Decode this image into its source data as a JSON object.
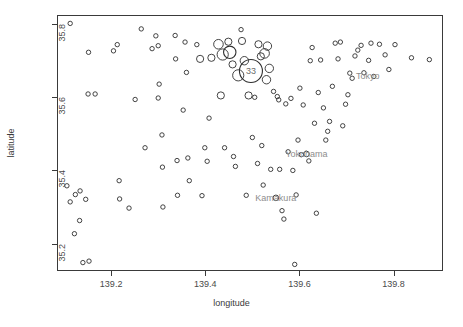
{
  "chart_data": {
    "type": "scatter",
    "title": "",
    "xlabel": "longitude",
    "ylabel": "latitude",
    "xlim": [
      139.085,
      139.905
    ],
    "ylim": [
      35.125,
      35.825
    ],
    "grid": false,
    "legend": "none",
    "marker": "open-circle",
    "size_encoding": "circle radius encodes magnitude/count",
    "xticks": [
      139.2,
      139.4,
      139.6,
      139.8
    ],
    "xtick_labels": [
      "139.2",
      "139.4",
      "139.6",
      "139.8"
    ],
    "yticks": [
      35.2,
      35.4,
      35.6,
      35.8
    ],
    "ytick_labels": [
      "35.2",
      "35.4",
      "35.6",
      "35.8"
    ],
    "annotations": [
      {
        "label": "Tokyo",
        "x": 139.745,
        "y": 35.657
      },
      {
        "label": "Yokohama",
        "x": 139.615,
        "y": 35.445
      },
      {
        "label": "Kamakura",
        "x": 139.55,
        "y": 35.325
      },
      {
        "label": "33",
        "x": 139.497,
        "y": 35.672
      }
    ],
    "points": [
      {
        "x": 139.113,
        "y": 35.802,
        "r": 2.2
      },
      {
        "x": 139.152,
        "y": 35.723,
        "r": 2.2
      },
      {
        "x": 139.151,
        "y": 35.609,
        "r": 2.2
      },
      {
        "x": 139.166,
        "y": 35.609,
        "r": 2.2
      },
      {
        "x": 139.106,
        "y": 35.358,
        "r": 2.2
      },
      {
        "x": 139.113,
        "y": 35.314,
        "r": 2.2
      },
      {
        "x": 139.124,
        "y": 35.334,
        "r": 2.2
      },
      {
        "x": 139.134,
        "y": 35.344,
        "r": 2.2
      },
      {
        "x": 139.146,
        "y": 35.321,
        "r": 2.2
      },
      {
        "x": 139.122,
        "y": 35.227,
        "r": 2.2
      },
      {
        "x": 139.133,
        "y": 35.263,
        "r": 2.2
      },
      {
        "x": 139.14,
        "y": 35.148,
        "r": 2.2
      },
      {
        "x": 139.153,
        "y": 35.152,
        "r": 2.2
      },
      {
        "x": 139.205,
        "y": 35.727,
        "r": 2.2
      },
      {
        "x": 139.213,
        "y": 35.744,
        "r": 2.2
      },
      {
        "x": 139.217,
        "y": 35.372,
        "r": 2.2
      },
      {
        "x": 139.218,
        "y": 35.322,
        "r": 2.2
      },
      {
        "x": 139.238,
        "y": 35.297,
        "r": 2.2
      },
      {
        "x": 139.251,
        "y": 35.594,
        "r": 2.2
      },
      {
        "x": 139.264,
        "y": 35.787,
        "r": 2.2
      },
      {
        "x": 139.272,
        "y": 35.462,
        "r": 2.2
      },
      {
        "x": 139.287,
        "y": 35.733,
        "r": 2.2
      },
      {
        "x": 139.295,
        "y": 35.768,
        "r": 2.2
      },
      {
        "x": 139.3,
        "y": 35.741,
        "r": 2.2
      },
      {
        "x": 139.3,
        "y": 35.598,
        "r": 2.2
      },
      {
        "x": 139.302,
        "y": 35.636,
        "r": 2.2
      },
      {
        "x": 139.308,
        "y": 35.497,
        "r": 2.2
      },
      {
        "x": 139.309,
        "y": 35.409,
        "r": 2.2
      },
      {
        "x": 139.31,
        "y": 35.3,
        "r": 2.2
      },
      {
        "x": 139.336,
        "y": 35.769,
        "r": 2.2
      },
      {
        "x": 139.337,
        "y": 35.705,
        "r": 2.2
      },
      {
        "x": 139.34,
        "y": 35.427,
        "r": 2.2
      },
      {
        "x": 139.341,
        "y": 35.332,
        "r": 2.2
      },
      {
        "x": 139.353,
        "y": 35.565,
        "r": 2.2
      },
      {
        "x": 139.357,
        "y": 35.751,
        "r": 2.2
      },
      {
        "x": 139.36,
        "y": 35.668,
        "r": 2.2
      },
      {
        "x": 139.363,
        "y": 35.434,
        "r": 2.2
      },
      {
        "x": 139.366,
        "y": 35.372,
        "r": 2.2
      },
      {
        "x": 139.382,
        "y": 35.744,
        "r": 2.2
      },
      {
        "x": 139.389,
        "y": 35.705,
        "r": 3.6
      },
      {
        "x": 139.393,
        "y": 35.331,
        "r": 2.2
      },
      {
        "x": 139.399,
        "y": 35.462,
        "r": 2.2
      },
      {
        "x": 139.404,
        "y": 35.425,
        "r": 2.2
      },
      {
        "x": 139.408,
        "y": 35.543,
        "r": 2.2
      },
      {
        "x": 139.413,
        "y": 35.708,
        "r": 3.6
      },
      {
        "x": 139.428,
        "y": 35.745,
        "r": 4.8
      },
      {
        "x": 139.433,
        "y": 35.605,
        "r": 3.6
      },
      {
        "x": 139.437,
        "y": 35.717,
        "r": 5.6
      },
      {
        "x": 139.441,
        "y": 35.462,
        "r": 2.2
      },
      {
        "x": 139.449,
        "y": 35.752,
        "r": 3.6
      },
      {
        "x": 139.452,
        "y": 35.723,
        "r": 6.2
      },
      {
        "x": 139.458,
        "y": 35.69,
        "r": 3.6
      },
      {
        "x": 139.46,
        "y": 35.438,
        "r": 2.2
      },
      {
        "x": 139.464,
        "y": 35.411,
        "r": 2.2
      },
      {
        "x": 139.47,
        "y": 35.66,
        "r": 5.6
      },
      {
        "x": 139.476,
        "y": 35.785,
        "r": 2.2
      },
      {
        "x": 139.478,
        "y": 35.754,
        "r": 3.6
      },
      {
        "x": 139.483,
        "y": 35.7,
        "r": 4.2
      },
      {
        "x": 139.487,
        "y": 35.332,
        "r": 2.2
      },
      {
        "x": 139.492,
        "y": 35.605,
        "r": 3.6
      },
      {
        "x": 139.497,
        "y": 35.672,
        "r": 11.5
      },
      {
        "x": 139.5,
        "y": 35.49,
        "r": 2.2
      },
      {
        "x": 139.505,
        "y": 35.6,
        "r": 2.2
      },
      {
        "x": 139.511,
        "y": 35.419,
        "r": 2.2
      },
      {
        "x": 139.513,
        "y": 35.745,
        "r": 3.6
      },
      {
        "x": 139.518,
        "y": 35.712,
        "r": 3.6
      },
      {
        "x": 139.52,
        "y": 35.468,
        "r": 2.2
      },
      {
        "x": 139.523,
        "y": 35.36,
        "r": 2.2
      },
      {
        "x": 139.526,
        "y": 35.72,
        "r": 4.8
      },
      {
        "x": 139.53,
        "y": 35.648,
        "r": 4.2
      },
      {
        "x": 139.532,
        "y": 35.74,
        "r": 4.2
      },
      {
        "x": 139.536,
        "y": 35.679,
        "r": 4.2
      },
      {
        "x": 139.539,
        "y": 35.403,
        "r": 2.2
      },
      {
        "x": 139.545,
        "y": 35.616,
        "r": 2.2
      },
      {
        "x": 139.55,
        "y": 35.325,
        "r": 2.8
      },
      {
        "x": 139.553,
        "y": 35.602,
        "r": 2.2
      },
      {
        "x": 139.556,
        "y": 35.593,
        "r": 2.2
      },
      {
        "x": 139.558,
        "y": 35.403,
        "r": 2.2
      },
      {
        "x": 139.563,
        "y": 35.29,
        "r": 2.2
      },
      {
        "x": 139.567,
        "y": 35.267,
        "r": 2.2
      },
      {
        "x": 139.571,
        "y": 35.582,
        "r": 2.2
      },
      {
        "x": 139.576,
        "y": 35.451,
        "r": 2.2
      },
      {
        "x": 139.582,
        "y": 35.597,
        "r": 2.2
      },
      {
        "x": 139.586,
        "y": 35.4,
        "r": 2.2
      },
      {
        "x": 139.59,
        "y": 35.143,
        "r": 2.2
      },
      {
        "x": 139.593,
        "y": 35.333,
        "r": 2.2
      },
      {
        "x": 139.597,
        "y": 35.483,
        "r": 2.2
      },
      {
        "x": 139.601,
        "y": 35.625,
        "r": 2.2
      },
      {
        "x": 139.604,
        "y": 35.443,
        "r": 2.2
      },
      {
        "x": 139.608,
        "y": 35.579,
        "r": 2.2
      },
      {
        "x": 139.615,
        "y": 35.445,
        "r": 2.8
      },
      {
        "x": 139.62,
        "y": 35.426,
        "r": 2.2
      },
      {
        "x": 139.623,
        "y": 35.7,
        "r": 2.2
      },
      {
        "x": 139.627,
        "y": 35.736,
        "r": 2.2
      },
      {
        "x": 139.632,
        "y": 35.529,
        "r": 2.2
      },
      {
        "x": 139.636,
        "y": 35.283,
        "r": 2.2
      },
      {
        "x": 139.64,
        "y": 35.613,
        "r": 2.2
      },
      {
        "x": 139.645,
        "y": 35.702,
        "r": 2.2
      },
      {
        "x": 139.651,
        "y": 35.571,
        "r": 2.2
      },
      {
        "x": 139.656,
        "y": 35.483,
        "r": 2.2
      },
      {
        "x": 139.66,
        "y": 35.507,
        "r": 2.2
      },
      {
        "x": 139.664,
        "y": 35.534,
        "r": 2.2
      },
      {
        "x": 139.67,
        "y": 35.63,
        "r": 2.2
      },
      {
        "x": 139.676,
        "y": 35.748,
        "r": 2.2
      },
      {
        "x": 139.682,
        "y": 35.705,
        "r": 2.2
      },
      {
        "x": 139.687,
        "y": 35.751,
        "r": 2.2
      },
      {
        "x": 139.692,
        "y": 35.522,
        "r": 2.2
      },
      {
        "x": 139.698,
        "y": 35.581,
        "r": 2.2
      },
      {
        "x": 139.703,
        "y": 35.607,
        "r": 2.2
      },
      {
        "x": 139.707,
        "y": 35.666,
        "r": 2.2
      },
      {
        "x": 139.712,
        "y": 35.652,
        "r": 2.2
      },
      {
        "x": 139.718,
        "y": 35.713,
        "r": 2.2
      },
      {
        "x": 139.724,
        "y": 35.729,
        "r": 2.2
      },
      {
        "x": 139.731,
        "y": 35.742,
        "r": 2.2
      },
      {
        "x": 139.737,
        "y": 35.667,
        "r": 2.2
      },
      {
        "x": 139.747,
        "y": 35.701,
        "r": 2.2
      },
      {
        "x": 139.752,
        "y": 35.748,
        "r": 2.2
      },
      {
        "x": 139.758,
        "y": 35.657,
        "r": 2.2
      },
      {
        "x": 139.77,
        "y": 35.745,
        "r": 2.2
      },
      {
        "x": 139.782,
        "y": 35.716,
        "r": 2.2
      },
      {
        "x": 139.79,
        "y": 35.676,
        "r": 2.2
      },
      {
        "x": 139.803,
        "y": 35.744,
        "r": 2.2
      },
      {
        "x": 139.838,
        "y": 35.708,
        "r": 2.2
      },
      {
        "x": 139.876,
        "y": 35.703,
        "r": 2.2
      }
    ]
  }
}
